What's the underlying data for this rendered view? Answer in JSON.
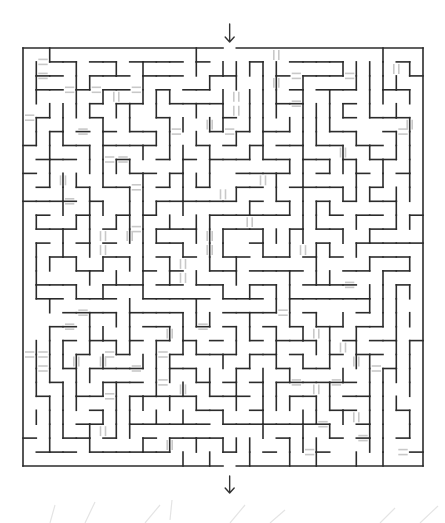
{
  "puzzle": {
    "type": "maze",
    "grid": {
      "columns": 30,
      "rows": 30
    },
    "entrance": {
      "side": "top",
      "column": 15,
      "icon": "arrow-down-icon"
    },
    "exit": {
      "side": "bottom",
      "column": 15,
      "icon": "arrow-down-icon"
    },
    "has_bridges": true,
    "colors": {
      "wall": "#2b2b2b",
      "bridge": "#c8c8c8",
      "background": "#ffffff"
    }
  }
}
